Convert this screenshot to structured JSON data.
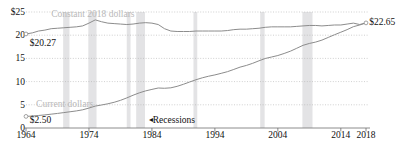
{
  "chart_data": {
    "type": "line",
    "title": "",
    "xlabel": "",
    "ylabel": "",
    "xlim": [
      1964,
      2018
    ],
    "ylim": [
      0,
      25
    ],
    "grid": true,
    "legend_position": "inline-labels",
    "yticks": [
      {
        "value": 25,
        "label": "$25"
      },
      {
        "value": 20,
        "label": "20"
      },
      {
        "value": 15,
        "label": "15"
      },
      {
        "value": 10,
        "label": "10"
      },
      {
        "value": 5,
        "label": "5"
      },
      {
        "value": 0,
        "label": "0"
      }
    ],
    "xticks": [
      {
        "value": 1964,
        "label": "1964"
      },
      {
        "value": 1974,
        "label": "1974"
      },
      {
        "value": 1984,
        "label": "1984"
      },
      {
        "value": 1994,
        "label": "1994"
      },
      {
        "value": 2004,
        "label": "2004"
      },
      {
        "value": 2014,
        "label": "2014"
      },
      {
        "value": 2018,
        "label": "2018"
      }
    ],
    "series": [
      {
        "name": "Constant 2018 dollars",
        "color": "#8c8c8c",
        "label_text": "Constant 2018 dollars",
        "start_value_label": "$20.27",
        "end_value_label": "$22.65",
        "x": [
          1964,
          1965,
          1966,
          1967,
          1968,
          1969,
          1970,
          1971,
          1972,
          1973,
          1974,
          1975,
          1976,
          1977,
          1978,
          1979,
          1980,
          1981,
          1982,
          1983,
          1984,
          1985,
          1986,
          1987,
          1988,
          1989,
          1990,
          1991,
          1992,
          1993,
          1994,
          1995,
          1996,
          1997,
          1998,
          1999,
          2000,
          2001,
          2002,
          2003,
          2004,
          2005,
          2006,
          2007,
          2008,
          2009,
          2010,
          2011,
          2012,
          2013,
          2014,
          2015,
          2016,
          2017,
          2018
        ],
        "y": [
          20.27,
          20.5,
          20.9,
          21.1,
          21.4,
          21.5,
          21.6,
          21.7,
          21.8,
          22.0,
          22.6,
          23.3,
          22.9,
          22.6,
          22.5,
          22.4,
          22.3,
          22.4,
          22.6,
          22.7,
          22.6,
          22.3,
          21.4,
          20.9,
          20.8,
          20.8,
          20.8,
          20.9,
          20.9,
          20.9,
          20.9,
          20.9,
          21.0,
          21.2,
          21.3,
          21.3,
          21.4,
          21.5,
          21.7,
          21.8,
          21.8,
          21.8,
          21.8,
          21.9,
          22.0,
          22.1,
          22.1,
          22.0,
          22.1,
          22.2,
          22.2,
          22.4,
          22.6,
          22.3,
          22.65
        ]
      },
      {
        "name": "Current dollars",
        "color": "#8c8c8c",
        "label_text": "Current dollars",
        "start_value_label": "$2.50",
        "end_value_label": "",
        "x": [
          1964,
          1965,
          1966,
          1967,
          1968,
          1969,
          1970,
          1971,
          1972,
          1973,
          1974,
          1975,
          1976,
          1977,
          1978,
          1979,
          1980,
          1981,
          1982,
          1983,
          1984,
          1985,
          1986,
          1987,
          1988,
          1989,
          1990,
          1991,
          1992,
          1993,
          1994,
          1995,
          1996,
          1997,
          1998,
          1999,
          2000,
          2001,
          2002,
          2003,
          2004,
          2005,
          2006,
          2007,
          2008,
          2009,
          2010,
          2011,
          2012,
          2013,
          2014,
          2015,
          2016,
          2017,
          2018
        ],
        "y": [
          2.5,
          2.58,
          2.7,
          2.82,
          2.98,
          3.14,
          3.32,
          3.5,
          3.68,
          3.92,
          4.3,
          4.72,
          4.96,
          5.22,
          5.54,
          5.96,
          6.48,
          7.06,
          7.58,
          8.0,
          8.32,
          8.62,
          8.56,
          8.66,
          8.98,
          9.42,
          9.92,
          10.4,
          10.82,
          11.16,
          11.44,
          11.78,
          12.14,
          12.62,
          13.12,
          13.48,
          13.94,
          14.48,
          14.98,
          15.3,
          15.62,
          16.06,
          16.56,
          17.18,
          17.82,
          18.22,
          18.52,
          18.94,
          19.52,
          20.1,
          20.64,
          21.2,
          21.84,
          22.2,
          22.65
        ]
      }
    ],
    "recession_bands": [
      {
        "start": 1969.9,
        "end": 1970.9
      },
      {
        "start": 1973.9,
        "end": 1975.2
      },
      {
        "start": 1980.0,
        "end": 1980.6
      },
      {
        "start": 1981.5,
        "end": 1982.9
      },
      {
        "start": 1990.6,
        "end": 1991.2
      },
      {
        "start": 2001.2,
        "end": 2001.9
      },
      {
        "start": 2007.9,
        "end": 2009.5
      }
    ],
    "recession_band_color": "#e3e3e5",
    "annotations": [
      {
        "name": "recessions",
        "text": "Recessions",
        "arrow": "◂",
        "x": 1983.5,
        "y": 1.6
      }
    ],
    "series_label_positions": [
      {
        "series": "Constant 2018 dollars",
        "x": 1968.0,
        "y": 24.3
      },
      {
        "series": "Current dollars",
        "x": 1965.6,
        "y": 5.0
      }
    ],
    "endpoint_markers": [
      {
        "series": "Constant 2018 dollars",
        "x": 1964,
        "y": 20.27,
        "label": "$20.27",
        "label_x": 1964.6,
        "label_y": 18.1
      },
      {
        "series": "Constant 2018 dollars",
        "x": 2018,
        "y": 22.65,
        "label": "$22.65",
        "label_x": 2018.5,
        "label_y": 22.65
      },
      {
        "series": "Current dollars",
        "x": 1964,
        "y": 2.5,
        "label": "$2.50",
        "label_x": 1964.6,
        "label_y": 1.5
      }
    ]
  }
}
